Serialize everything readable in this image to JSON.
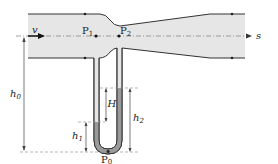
{
  "diagram": {
    "labels": {
      "velocity": "v",
      "axis": "s",
      "p1": "P",
      "p1_sub": "1",
      "p2": "P",
      "p2_sub": "2",
      "p0": "P",
      "p0_sub": "0",
      "h0": "h",
      "h0_sub": "0",
      "h1": "h",
      "h1_sub": "1",
      "h2": "h",
      "h2_sub": "2",
      "H": "H"
    },
    "colors": {
      "pipe_fill": "#e6e6e6",
      "pipe_stroke": "#333333",
      "manometer_fluid": "#9a9a9a",
      "tube_inner": "#e6e6e6",
      "dash": "#999999"
    }
  }
}
